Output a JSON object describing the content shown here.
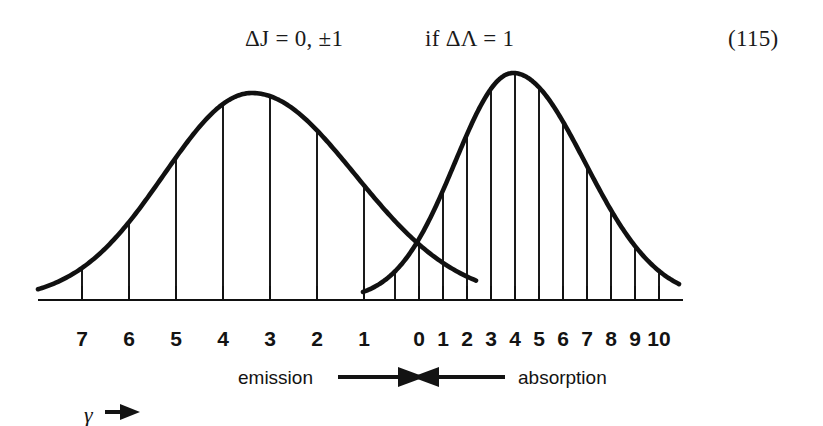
{
  "formula": {
    "selection_rule": "ΔJ = 0, ±1",
    "condition": "if ΔΛ = 1",
    "equation_number": "(115)"
  },
  "annotations": {
    "emission_label": "emission",
    "absorption_label": "absorption",
    "gamma_label": "γ"
  },
  "axis": {
    "left_tick_labels": [
      "7",
      "6",
      "5",
      "4",
      "3",
      "2",
      "1"
    ],
    "right_tick_labels": [
      "0",
      "1",
      "2",
      "3",
      "4",
      "5",
      "6",
      "7",
      "8",
      "9",
      "10"
    ]
  },
  "colors": {
    "curve": "#111111",
    "axis": "#111111",
    "droplines": "#1a1a1a",
    "text": "#131313",
    "background": "#ffffff"
  },
  "chart_data": {
    "type": "line",
    "title": "",
    "subtitle": "",
    "xlabel": "",
    "ylabel": "",
    "grid": false,
    "legend_position": "bottom",
    "axes": {
      "baseline_y_px": 300,
      "left_branch": {
        "direction": "decreasing",
        "tick_values": [
          7,
          6,
          5,
          4,
          3,
          2,
          1
        ],
        "tick_x_px": [
          82,
          129,
          176,
          223,
          270,
          317,
          364
        ],
        "spacing_px": 47
      },
      "right_branch": {
        "direction": "increasing",
        "tick_values": [
          0,
          1,
          2,
          3,
          4,
          5,
          6,
          7,
          8,
          9,
          10
        ],
        "tick_x_px": [
          419,
          443,
          467,
          491,
          515,
          539,
          563,
          587,
          611,
          635,
          659
        ],
        "spacing_px": 24
      }
    },
    "series": [
      {
        "name": "emission",
        "peak_x_px": 252,
        "peak_y_px": 93,
        "start_px": [
          38,
          270
        ],
        "end_px": [
          476,
          268
        ],
        "drop_lines_x_px": [
          82,
          129,
          176,
          223,
          270,
          317,
          364,
          419,
          443,
          467
        ],
        "drop_line_heights_px": [
          254,
          219,
          165,
          111,
          95,
          123,
          182,
          239,
          254,
          265
        ]
      },
      {
        "name": "absorption",
        "peak_x_px": 513,
        "peak_y_px": 73,
        "start_px": [
          363,
          300
        ],
        "end_px": [
          679,
          298
        ],
        "drop_lines_x_px": [
          395,
          419,
          443,
          467,
          491,
          515,
          539,
          563,
          587,
          611,
          635,
          659
        ],
        "drop_line_heights_px": [
          188,
          152,
          197,
          238,
          266,
          272,
          266,
          237,
          196,
          152,
          114,
          82
        ]
      }
    ]
  }
}
